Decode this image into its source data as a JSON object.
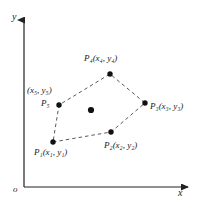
{
  "figure": {
    "type": "geometry-diagram",
    "background_color": "#ffffff",
    "line_color": "#555555",
    "point_color": "#111111",
    "axis_color": "#222222"
  },
  "axes": {
    "y_label": "y",
    "x_label": "x",
    "origin_label": "o",
    "y_axis": {
      "x": 24,
      "y_top": 18,
      "y_bottom": 187
    },
    "x_axis": {
      "y": 187,
      "x_left": 24,
      "x_right": 190
    }
  },
  "points": [
    {
      "id": "P1",
      "name": "P",
      "index": "1",
      "label": "P₁(x₁, y₁)",
      "coord_text": "(x₁, y₁)",
      "x": 53,
      "y": 142,
      "label_x": 34,
      "label_y": 150
    },
    {
      "id": "P2",
      "name": "P",
      "index": "2",
      "label": "P₂(x₂, y₂)",
      "coord_text": "(x₂, y₂)",
      "x": 111,
      "y": 132,
      "label_x": 106,
      "label_y": 143
    },
    {
      "id": "P3",
      "name": "P",
      "index": "3",
      "label": "P₃(x₃, y₃)",
      "coord_text": "(x₃, y₃)",
      "x": 145,
      "y": 103,
      "label_x": 150,
      "label_y": 104
    },
    {
      "id": "P4",
      "name": "P",
      "index": "4",
      "label": "P₄(x₄, y₄)",
      "coord_text": "(x₄, y₄)",
      "x": 110,
      "y": 74,
      "label_x": 84,
      "label_y": 56
    },
    {
      "id": "P5",
      "name": "P",
      "index": "5",
      "label": "P₅",
      "coord_text": "(x₅, y₅)",
      "x": 59,
      "y": 105,
      "label_x": 41,
      "label_y": 101,
      "coord_label_x": 27,
      "coord_label_y": 88
    }
  ],
  "centroid": {
    "id": "center",
    "x": 91,
    "y": 110,
    "label": ""
  },
  "polygon_order": [
    "P1",
    "P2",
    "P3",
    "P4",
    "P5"
  ]
}
